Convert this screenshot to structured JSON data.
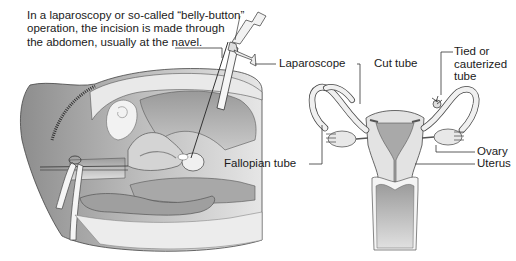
{
  "caption": {
    "lines": [
      "In a laparoscopy or so-called “belly-button”",
      "operation, the incision is made through",
      "the abdomen, usually at the navel."
    ]
  },
  "labels": {
    "laparoscope": "Laparoscope",
    "cut_tube": "Cut tube",
    "tied_tube": [
      "Tied or",
      "cauterized",
      "tube"
    ],
    "ovary": "Ovary",
    "uterus": "Uterus",
    "fallopian_tube": "Fallopian tube"
  },
  "figures": {
    "left": "sagittal-abdomen-cross-section-with-laparoscope",
    "right": "frontal-uterus-with-fallopian-tubes-and-ovaries"
  },
  "colors": {
    "ink": "#1a1a1a",
    "line": "#333333",
    "shade_dark": "#8a8a8a",
    "shade_mid": "#b5b5b5",
    "shade_light": "#dcdcdc",
    "paper": "#ffffff"
  }
}
